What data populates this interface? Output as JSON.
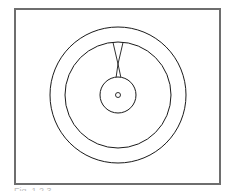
{
  "figure": {
    "frame_color": "#6e6e6e",
    "stroke_color": "#1a1a1a",
    "caption": "Fig. 1.2.3"
  },
  "shapes": {
    "outer_ring": {
      "cx": 118,
      "cy": 95,
      "r": 68
    },
    "middle_ring": {
      "cx": 118,
      "cy": 95,
      "r": 53
    },
    "hub": {
      "cx": 118,
      "cy": 95,
      "r": 18
    },
    "center_hole": {
      "cx": 118,
      "cy": 95,
      "r": 2.5
    },
    "hourglass_neck": {
      "top_left_x": 113,
      "top_right_x": 123,
      "top_y": 42,
      "waist_x": 118,
      "waist_y": 64,
      "bottom_left_x": 116,
      "bottom_right_x": 121,
      "bottom_y": 78
    }
  }
}
